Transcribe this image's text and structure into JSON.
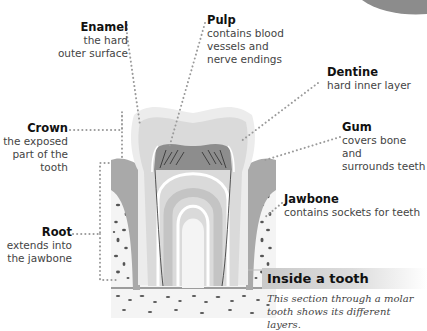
{
  "diagram": {
    "labels": [
      {
        "id": "enamel",
        "title": "Enamel",
        "description": "the hard outer surface",
        "lines": [
          "the hard",
          "outer surface"
        ]
      },
      {
        "id": "pulp",
        "title": "Pulp",
        "description": "contains blood vessels and nerve endings",
        "lines": [
          "contains blood",
          "vessels and",
          "nerve endings"
        ]
      },
      {
        "id": "dentine",
        "title": "Dentine",
        "description": "hard inner layer",
        "lines": [
          "hard inner layer"
        ]
      },
      {
        "id": "crown",
        "title": "Crown",
        "description": "the exposed part of the tooth",
        "lines": [
          "the exposed",
          "part of the",
          "tooth"
        ]
      },
      {
        "id": "gum",
        "title": "Gum",
        "description": "covers bone and surrounds teeth",
        "lines": [
          "covers bone and",
          "surrounds teeth"
        ]
      },
      {
        "id": "jawbone",
        "title": "Jawbone",
        "description": "contains sockets for teeth",
        "lines": [
          "contains sockets for teeth"
        ]
      },
      {
        "id": "root",
        "title": "Root",
        "description": "extends into the jawbone",
        "lines": [
          "extends into",
          "the jawbone"
        ]
      }
    ],
    "caption": {
      "title": "Inside a tooth",
      "text": "This section through a molar tooth shows its different layers.",
      "lines": [
        "This section through a molar",
        "tooth shows its different layers."
      ]
    },
    "colors": {
      "enamel": "#ebebeb",
      "dentine": "#d6d6d6",
      "gum": "#a9a9a9",
      "pulp": "#8a8a8a",
      "bone": "#f2f2f2",
      "leader": "#999999",
      "caption_band": "#c9c9c9"
    }
  }
}
